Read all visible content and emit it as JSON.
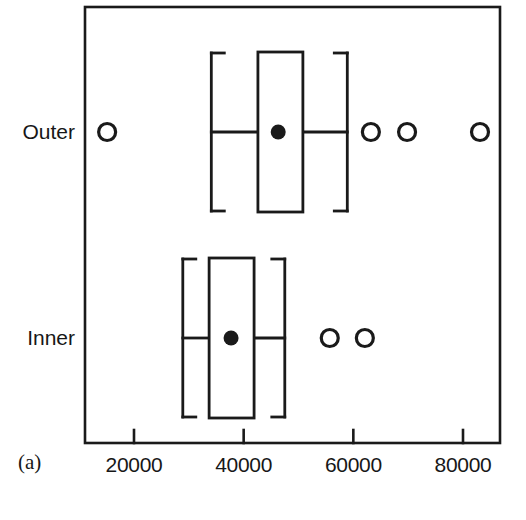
{
  "figure": {
    "panel_label": "(a)",
    "background_color": "#ffffff",
    "line_color": "#1a1a1a"
  },
  "chart_data": {
    "type": "boxplot",
    "orientation": "horizontal",
    "title": "",
    "xlabel": "",
    "ylabel": "",
    "xlim": [
      11500,
      86300
    ],
    "grid": false,
    "legend": null,
    "categories": [
      "Outer",
      "Inner"
    ],
    "axis": {
      "tick_values": [
        20000,
        40000,
        60000,
        80000
      ],
      "tick_labels": [
        "20000",
        "40000",
        "60000",
        "80000"
      ]
    },
    "boxes": [
      {
        "name": "Outer",
        "whisker_low": 34100,
        "q1": 42600,
        "median": 46300,
        "q3": 50800,
        "whisker_high": 58900,
        "outliers": [
          15100,
          63200,
          69800,
          83100
        ]
      },
      {
        "name": "Inner",
        "whisker_low": 28900,
        "q1": 33700,
        "median": 37700,
        "q3": 41900,
        "whisker_high": 47500,
        "outliers": [
          55700,
          62100
        ]
      }
    ]
  }
}
